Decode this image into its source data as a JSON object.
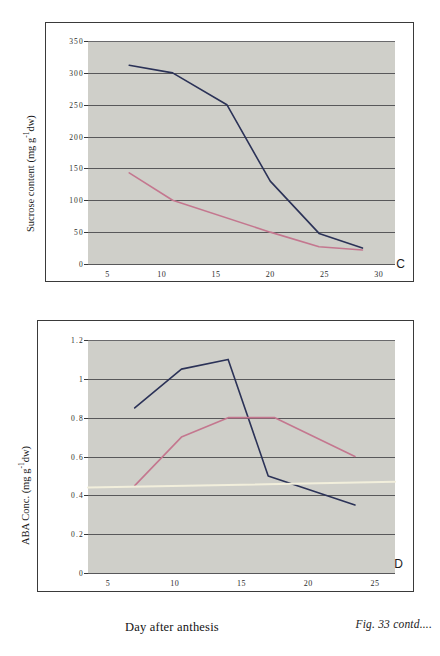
{
  "figure": {
    "caption": "Fig. 33 contd....",
    "xaxis_title": "Day after anthesis"
  },
  "panels": [
    {
      "letter": "C",
      "yaxis_title_prefix": "Sucrose content (mg g",
      "yaxis_title_sup": "-1",
      "yaxis_title_suffix": "dw)",
      "ylabels": [
        "350",
        "300",
        "250",
        "200",
        "150",
        "100",
        "50",
        "0"
      ],
      "xlabels": [
        "5",
        "10",
        "15",
        "20",
        "25",
        "30"
      ]
    },
    {
      "letter": "D",
      "yaxis_title_prefix": "ABA Conc. (mg g",
      "yaxis_title_sup": "-1",
      "yaxis_title_suffix": "dw)",
      "ylabels": [
        "1.2",
        "1",
        "0.8",
        "0.6",
        "0.4",
        "0.2",
        "0"
      ],
      "xlabels": [
        "5",
        "10",
        "15",
        "20",
        "25"
      ]
    }
  ],
  "colors": {
    "series_blue": "#2b3257",
    "series_pink": "#c4778f",
    "plot_background": "#cfcfc9",
    "gridline": "#58585a",
    "cream_line": "#f2efdc",
    "frame": "#3a3a3a"
  },
  "chart_data": [
    {
      "type": "line",
      "panel": "C",
      "title": "",
      "xlabel": "Day after anthesis",
      "ylabel": "Sucrose content (mg g-1dw)",
      "xlim": [
        3.2,
        31.5
      ],
      "ylim": [
        0,
        350
      ],
      "yticks": [
        0,
        50,
        100,
        150,
        200,
        250,
        300,
        350
      ],
      "xticks": [
        5,
        10,
        15,
        20,
        25,
        30
      ],
      "grid": true,
      "legend": "none",
      "series": [
        {
          "name": "series-blue",
          "color": "#2b3257",
          "x": [
            7,
            11,
            16,
            20,
            24.5,
            28.5
          ],
          "values": [
            312,
            300,
            250,
            130,
            48,
            25
          ]
        },
        {
          "name": "series-pink",
          "color": "#c4778f",
          "x": [
            7,
            11,
            20,
            24.5,
            28.5
          ],
          "values": [
            143,
            100,
            50,
            27,
            22
          ]
        }
      ]
    },
    {
      "type": "line",
      "panel": "D",
      "title": "",
      "xlabel": "Day after anthesis",
      "ylabel": "ABA Conc. (mg g-1dw)",
      "xlim": [
        3.5,
        26.5
      ],
      "ylim": [
        0,
        1.2
      ],
      "yticks": [
        0,
        0.2,
        0.4,
        0.6,
        0.8,
        1.0,
        1.2
      ],
      "xticks": [
        5,
        10,
        15,
        20,
        25
      ],
      "grid": true,
      "legend": "none",
      "series": [
        {
          "name": "series-blue",
          "color": "#2b3257",
          "x": [
            7,
            10.5,
            14,
            17,
            23.5
          ],
          "values": [
            0.85,
            1.05,
            1.1,
            0.5,
            0.35
          ]
        },
        {
          "name": "series-pink",
          "color": "#c4778f",
          "x": [
            7,
            10.5,
            14,
            17.5,
            23.5
          ],
          "values": [
            0.45,
            0.7,
            0.8,
            0.8,
            0.6
          ]
        },
        {
          "name": "series-cream-baseline",
          "color": "#f2efdc",
          "x": [
            3.5,
            26.5
          ],
          "values": [
            0.44,
            0.47
          ]
        }
      ]
    }
  ]
}
